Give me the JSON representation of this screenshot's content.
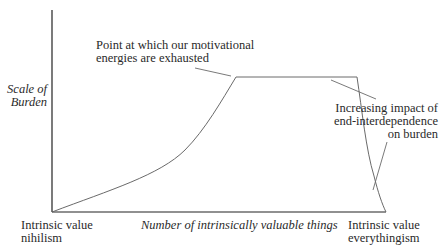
{
  "diagram": {
    "y_axis_label": [
      "Scale of",
      "Burden"
    ],
    "x_axis_label": "Number of intrinsically valuable things",
    "left_endpoint_label": [
      "Intrinsic value",
      "nihilism"
    ],
    "right_endpoint_label": [
      "Intrinsic value",
      "everythingism"
    ],
    "annotations": {
      "peak": [
        "Point at which our motivational",
        "energies are exhausted"
      ],
      "decline": [
        "Increasing impact of",
        "end-interdependence",
        "on burden"
      ]
    },
    "colors": {
      "curve": "#6a6a6a",
      "axis": "#222222",
      "text": "#2a2a2a"
    }
  }
}
